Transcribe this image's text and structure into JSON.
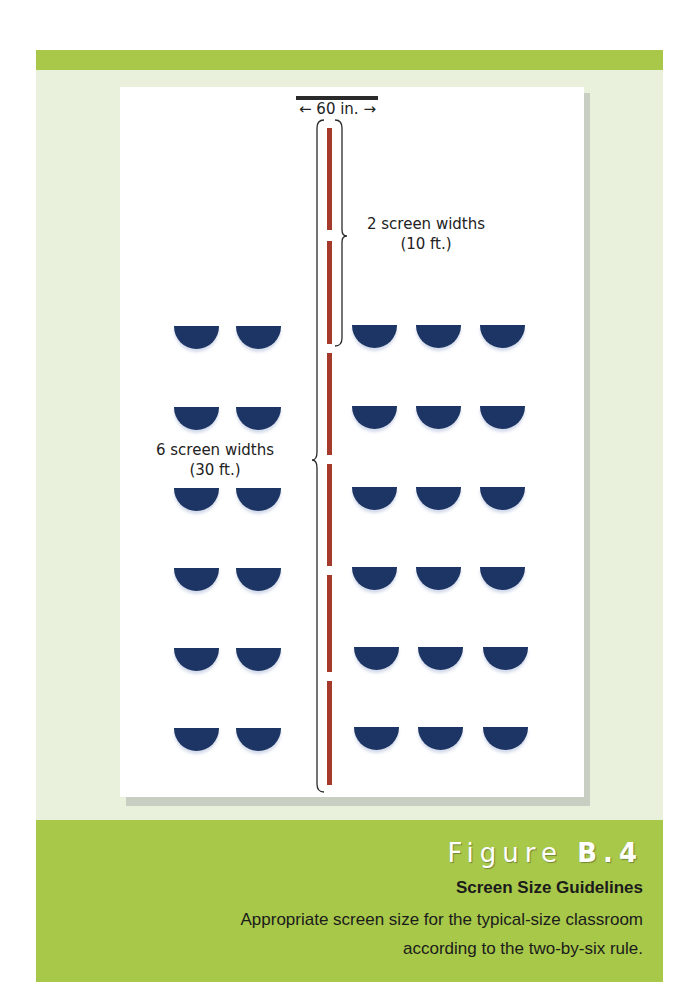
{
  "diagram": {
    "screen_width_label": "← 60 in. →",
    "near_bracket_label_line1": "2 screen widths",
    "near_bracket_label_line2": "(10 ft.)",
    "far_bracket_label_line1": "6 screen widths",
    "far_bracket_label_line2": "(30 ft.)",
    "desk_color": "#1c3565",
    "centerline_color": "#a43a2c",
    "rows": 6,
    "left_columns": 2,
    "right_columns": 3
  },
  "caption": {
    "figure_word": "Figure",
    "figure_number": "B.4",
    "title": "Screen Size Guidelines",
    "description": "Appropriate screen size for the typical-size classroom according to the two-by-six rule."
  },
  "colors": {
    "green_band": "#a9c84a",
    "frame_bg": "#e9f1dc"
  }
}
